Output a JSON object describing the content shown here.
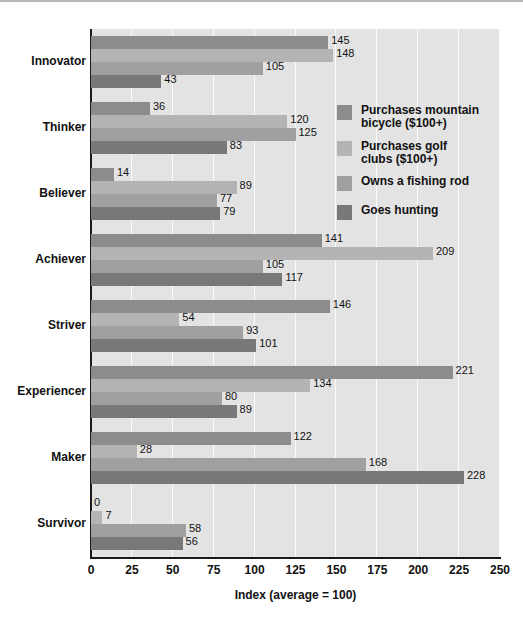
{
  "chart_data": {
    "type": "bar",
    "orientation": "horizontal",
    "title": "",
    "xlabel": "Index (average = 100)",
    "ylabel": "",
    "xlim": [
      0,
      250
    ],
    "xticks": [
      0,
      25,
      50,
      75,
      100,
      125,
      150,
      175,
      200,
      225,
      250
    ],
    "xtick_labels": [
      "0",
      "25",
      "50",
      "75",
      "100",
      "125",
      "150",
      "175",
      "200",
      "225",
      "250"
    ],
    "grid": true,
    "grid_axis": "x",
    "legend_position": "inside-right",
    "categories": [
      "Innovator",
      "Thinker",
      "Believer",
      "Achiever",
      "Striver",
      "Experiencer",
      "Maker",
      "Survivor"
    ],
    "series": [
      {
        "name": "Purchases mountain bicycle ($100+)",
        "color": "#8c8c8c",
        "values": [
          145,
          36,
          14,
          141,
          146,
          221,
          122,
          0
        ]
      },
      {
        "name": "Purchases golf clubs ($100+)",
        "color": "#b4b4b4",
        "values": [
          148,
          120,
          89,
          209,
          54,
          134,
          28,
          7
        ]
      },
      {
        "name": "Owns a fishing rod",
        "color": "#a0a0a0",
        "values": [
          105,
          125,
          77,
          105,
          93,
          80,
          168,
          58
        ]
      },
      {
        "name": "Goes hunting",
        "color": "#787878",
        "values": [
          43,
          83,
          79,
          117,
          101,
          89,
          228,
          56
        ]
      }
    ]
  },
  "legend": {
    "entries": [
      "Purchases mountain\nbicycle ($100+)",
      "Purchases golf\nclubs ($100+)",
      "Owns a fishing rod",
      "Goes hunting"
    ]
  },
  "colors": {
    "plot_background": "#e3e3e3",
    "gridline": "#fbfbfb",
    "axis": "#1a1a1a",
    "text": "#111111",
    "page_background": "#ffffff"
  }
}
